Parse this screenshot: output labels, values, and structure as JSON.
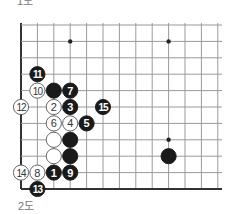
{
  "captions": {
    "top": "1도",
    "bottom": "2도"
  },
  "board": {
    "origin_x": 21,
    "origin_y": 25,
    "spacing": 16.4,
    "cols": 13,
    "rows": 11,
    "right_extent": 222,
    "edges": {
      "left": true,
      "bottom": true,
      "top": false,
      "right": false
    },
    "line_color": "#9a9a9a",
    "edge_color": "#333333",
    "hoshi": [
      [
        3,
        1
      ],
      [
        9,
        1
      ],
      [
        9,
        7
      ]
    ]
  },
  "stones": [
    {
      "col": 1,
      "row": 3,
      "color": "black",
      "label": "11"
    },
    {
      "col": 1,
      "row": 4,
      "color": "white",
      "label": "10"
    },
    {
      "col": 2,
      "row": 4,
      "color": "black",
      "label": ""
    },
    {
      "col": 3,
      "row": 4,
      "color": "black",
      "label": "7"
    },
    {
      "col": 0,
      "row": 5,
      "color": "white",
      "label": "12"
    },
    {
      "col": 2,
      "row": 5,
      "color": "white",
      "label": "2"
    },
    {
      "col": 3,
      "row": 5,
      "color": "black",
      "label": "3"
    },
    {
      "col": 5,
      "row": 5,
      "color": "black",
      "label": "15"
    },
    {
      "col": 2,
      "row": 6,
      "color": "white",
      "label": "6"
    },
    {
      "col": 3,
      "row": 6,
      "color": "white",
      "label": "4"
    },
    {
      "col": 4,
      "row": 6,
      "color": "black",
      "label": "5"
    },
    {
      "col": 2,
      "row": 7,
      "color": "white",
      "label": ""
    },
    {
      "col": 3,
      "row": 7,
      "color": "black",
      "label": ""
    },
    {
      "col": 2,
      "row": 8,
      "color": "white",
      "label": ""
    },
    {
      "col": 3,
      "row": 8,
      "color": "black",
      "label": ""
    },
    {
      "col": 9,
      "row": 8,
      "color": "black",
      "label": ""
    },
    {
      "col": 0,
      "row": 9,
      "color": "white",
      "label": "14"
    },
    {
      "col": 1,
      "row": 9,
      "color": "white",
      "label": "8"
    },
    {
      "col": 2,
      "row": 9,
      "color": "black",
      "label": "1"
    },
    {
      "col": 3,
      "row": 9,
      "color": "black",
      "label": "9"
    },
    {
      "col": 1,
      "row": 10,
      "color": "black",
      "label": "13"
    }
  ]
}
